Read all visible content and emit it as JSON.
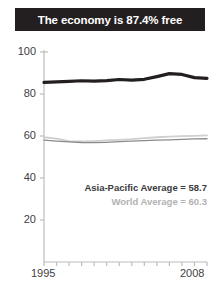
{
  "title": {
    "text": "The economy is 87.4% free"
  },
  "annotations": {
    "regional": "Asia-Pacific Average = 58.7",
    "world": "World Average = 60.3"
  },
  "axis": {
    "x_start_label": "1995",
    "x_end_label": "2008",
    "y_labels": [
      "100",
      "80",
      "60",
      "40",
      "20"
    ]
  },
  "colors": {
    "title_bar": "#231f20",
    "title_text": "#ffffff",
    "country_line": "#231f20",
    "regional_line": "#8c8c8c",
    "world_line": "#cfcfcf",
    "axis": "#bcbcbc",
    "tick_text": "#414042"
  },
  "chart_data": {
    "type": "line",
    "title": "The economy is 87.4% free",
    "xlabel": "",
    "ylabel": "",
    "xlim": [
      1995,
      2008
    ],
    "ylim": [
      0,
      100
    ],
    "yticks": [
      20,
      40,
      60,
      80,
      100
    ],
    "xticks": [
      1995,
      1996,
      1997,
      1998,
      1999,
      2000,
      2001,
      2002,
      2003,
      2004,
      2005,
      2006,
      2007,
      2008
    ],
    "x": [
      1995,
      1996,
      1997,
      1998,
      1999,
      2000,
      2001,
      2002,
      2003,
      2004,
      2005,
      2006,
      2007,
      2008
    ],
    "grid": false,
    "legend": "none",
    "series": [
      {
        "name": "Country score",
        "color": "#231f20",
        "width": 3.2,
        "values": [
          85.5,
          85.8,
          86.0,
          86.3,
          86.1,
          86.4,
          86.9,
          86.6,
          87.0,
          88.3,
          89.7,
          89.3,
          87.8,
          87.4
        ]
      },
      {
        "name": "Asia-Pacific Average",
        "color": "#8c8c8c",
        "width": 1.3,
        "values": [
          58.0,
          57.6,
          57.2,
          56.9,
          56.8,
          57.0,
          57.3,
          57.6,
          57.8,
          58.0,
          58.2,
          58.4,
          58.6,
          58.7
        ]
      },
      {
        "name": "World Average",
        "color": "#cfcfcf",
        "width": 1.8,
        "values": [
          59.4,
          58.7,
          57.6,
          57.4,
          57.6,
          57.9,
          58.2,
          58.5,
          59.0,
          59.4,
          59.7,
          59.9,
          60.1,
          60.3
        ]
      }
    ],
    "annotations": [
      {
        "text": "Asia-Pacific Average = 58.7",
        "color": "#3b3b3d"
      },
      {
        "text": "World Average = 60.3",
        "color": "#b2b2b2"
      }
    ]
  }
}
